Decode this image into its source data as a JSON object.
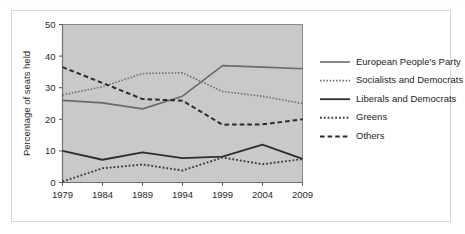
{
  "chart_data": {
    "type": "line",
    "title": "",
    "xlabel": "",
    "ylabel": "Percentage of seats held",
    "x": [
      1979,
      1984,
      1989,
      1994,
      1999,
      2004,
      2009
    ],
    "categories": [
      "1979",
      "1984",
      "1989",
      "1994",
      "1999",
      "2004",
      "2009"
    ],
    "xlim": [
      1979,
      2009
    ],
    "ylim": [
      0,
      50
    ],
    "yticks": [
      0,
      10,
      20,
      30,
      40,
      50
    ],
    "ytick_labels": [
      "0",
      "10",
      "20",
      "30",
      "40",
      "50"
    ],
    "grid": false,
    "legend_position": "right",
    "plot_background": "#c9c9c9",
    "series": [
      {
        "name": "European People's Party",
        "values": [
          26,
          25.2,
          23.3,
          27.3,
          37,
          36.5,
          36
        ],
        "style": "solid",
        "color": "#6b6b6b",
        "width": 1.6
      },
      {
        "name": "Socialists and Democrats",
        "values": [
          27.7,
          30.3,
          34.5,
          34.7,
          28.8,
          27.3,
          25
        ],
        "style": "dotted",
        "color": "#6e6e6e",
        "width": 1.6
      },
      {
        "name": "Liberals and Democrats",
        "values": [
          10,
          7.2,
          9.5,
          7.7,
          8.2,
          12,
          7.5
        ],
        "style": "solid",
        "color": "#2e2e2e",
        "width": 1.8
      },
      {
        "name": "Greens",
        "values": [
          0.3,
          4.5,
          5.7,
          3.8,
          7.9,
          5.8,
          7.4
        ],
        "style": "dotted",
        "color": "#3a3a3a",
        "width": 1.9
      },
      {
        "name": "Others",
        "values": [
          36.5,
          31.5,
          26.4,
          25.9,
          18.3,
          18.4,
          20
        ],
        "style": "dashed",
        "color": "#2b2b2b",
        "width": 2.0
      }
    ]
  },
  "legend": {
    "items": [
      {
        "label": "European People's Party"
      },
      {
        "label": "Socialists and Democrats"
      },
      {
        "label": "Liberals and Democrats"
      },
      {
        "label": "Greens"
      },
      {
        "label": "Others"
      }
    ]
  }
}
